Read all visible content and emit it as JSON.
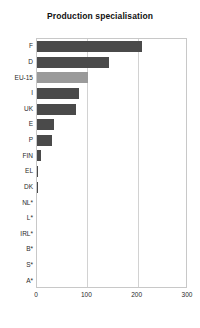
{
  "chart_data": {
    "type": "bar",
    "orientation": "horizontal",
    "title": "Production specialisation",
    "subtitle": "",
    "xlabel": "",
    "ylabel": "",
    "categories": [
      "F",
      "D",
      "EU-15",
      "I",
      "UK",
      "E",
      "P",
      "FIN",
      "EL",
      "DK",
      "NL*",
      "L*",
      "IRL*",
      "B*",
      "S*",
      "A*"
    ],
    "values": [
      209,
      143,
      101,
      83,
      78,
      34,
      30,
      8,
      2,
      1,
      0,
      0,
      0,
      0,
      0,
      0
    ],
    "series": [
      {
        "name": "Production specialisation",
        "values": [
          209,
          143,
          101,
          83,
          78,
          34,
          30,
          8,
          2,
          1,
          0,
          0,
          0,
          0,
          0,
          0
        ]
      }
    ],
    "xlim": [
      0,
      300
    ],
    "xticks": [
      0,
      100,
      200,
      300
    ],
    "xtick_labels": [
      "0",
      "100",
      "200",
      "300"
    ],
    "grid": "vertical",
    "legend": "none",
    "bar_color": "#4a4a4a",
    "highlight_category": "EU-15",
    "highlight_color": "#9a9a9a",
    "frame_color": "#c8c8c8",
    "gridline_color": "#d2d2d2"
  }
}
